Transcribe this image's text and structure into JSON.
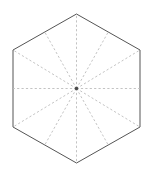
{
  "figure": {
    "background_color": "#ffffff",
    "canvas": {
      "width": 150,
      "height": 176
    }
  },
  "chart_data": {
    "type": "diagram",
    "subtitle": "",
    "xlabel": "",
    "ylabel": "",
    "grid": false,
    "legend": null,
    "shapes": [
      {
        "name": "hexagon",
        "kind": "polygon",
        "sides": 6,
        "orientation": "pointy-top",
        "stroke_color": "#555555",
        "stroke_width": 1,
        "fill_color": "#ffffff",
        "dashed": false,
        "center": {
          "x": 76.5,
          "y": 88.5
        },
        "circumradius": 74.5,
        "vertices": [
          {
            "label": "top",
            "x": 76.5,
            "y": 14.0
          },
          {
            "label": "upper-right",
            "x": 140.0,
            "y": 50.0
          },
          {
            "label": "lower-right",
            "x": 140.0,
            "y": 127.0
          },
          {
            "label": "bottom",
            "x": 76.5,
            "y": 163.0
          },
          {
            "label": "lower-left",
            "x": 13.0,
            "y": 127.0
          },
          {
            "label": "upper-left",
            "x": 13.0,
            "y": 50.0
          }
        ],
        "edge_midpoints": [
          {
            "label": "upper-right-edge",
            "x": 108.25,
            "y": 32.0
          },
          {
            "label": "right-edge",
            "x": 140.0,
            "y": 88.5
          },
          {
            "label": "lower-right-edge",
            "x": 108.25,
            "y": 145.0
          },
          {
            "label": "lower-left-edge",
            "x": 44.75,
            "y": 145.0
          },
          {
            "label": "left-edge",
            "x": 13.0,
            "y": 88.5
          },
          {
            "label": "upper-left-edge",
            "x": 44.75,
            "y": 32.0
          }
        ]
      },
      {
        "name": "radial-lines",
        "kind": "line-set",
        "count": 12,
        "stroke_color": "#bcbcbc",
        "stroke_width": 0.9,
        "dashed": true,
        "dash_pattern": "2.2 2.2",
        "origin": {
          "x": 76.5,
          "y": 88.5
        },
        "endpoints": [
          {
            "label": "spoke-to-top-vertex",
            "x": 76.5,
            "y": 14.0
          },
          {
            "label": "spoke-to-upper-right-edge-midpoint",
            "x": 108.25,
            "y": 32.0
          },
          {
            "label": "spoke-to-upper-right-vertex",
            "x": 140.0,
            "y": 50.0
          },
          {
            "label": "spoke-to-right-edge-midpoint",
            "x": 140.0,
            "y": 88.5
          },
          {
            "label": "spoke-to-lower-right-vertex",
            "x": 140.0,
            "y": 127.0
          },
          {
            "label": "spoke-to-lower-right-edge-midpoint",
            "x": 108.25,
            "y": 145.0
          },
          {
            "label": "spoke-to-bottom-vertex",
            "x": 76.5,
            "y": 163.0
          },
          {
            "label": "spoke-to-lower-left-edge-midpoint",
            "x": 44.75,
            "y": 145.0
          },
          {
            "label": "spoke-to-lower-left-vertex",
            "x": 13.0,
            "y": 127.0
          },
          {
            "label": "spoke-to-left-edge-midpoint",
            "x": 13.0,
            "y": 88.5
          },
          {
            "label": "spoke-to-upper-left-vertex",
            "x": 13.0,
            "y": 50.0
          },
          {
            "label": "spoke-to-upper-left-edge-midpoint",
            "x": 44.75,
            "y": 32.0
          }
        ]
      },
      {
        "name": "center-point",
        "kind": "dot",
        "x": 76.5,
        "y": 88.5,
        "radius": 1.8,
        "fill_color": "#4a4a4a"
      }
    ],
    "annotations": [],
    "colors": {
      "outline": "#555555",
      "dashed_lines": "#bcbcbc",
      "center_dot": "#4a4a4a",
      "background": "#ffffff"
    }
  }
}
